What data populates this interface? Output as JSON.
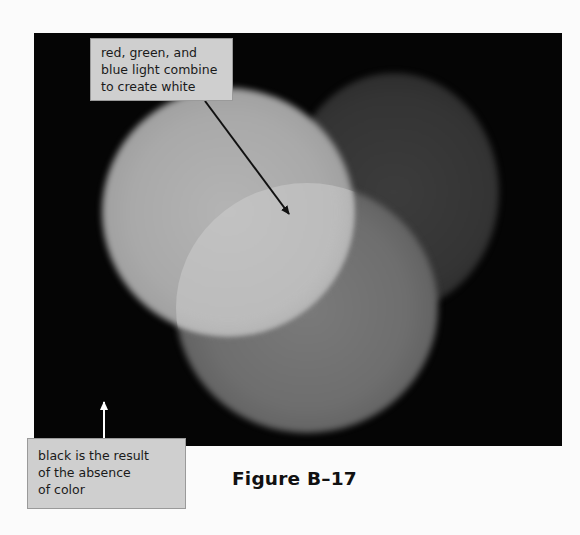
{
  "figure": {
    "caption": "Figure B–17"
  },
  "callouts": {
    "top": {
      "lines": [
        "red, green, and",
        "blue light combine",
        "to create white"
      ],
      "arrow_color": "#111111"
    },
    "bottom": {
      "lines": [
        "black is the result",
        "of the absence",
        "of color"
      ],
      "arrow_color": "#ffffff"
    }
  },
  "colors": {
    "page_background": "#fbfbfb",
    "photo_background": "#050505",
    "label_background": "#cfcfcf",
    "label_border": "#9a9a9a"
  }
}
